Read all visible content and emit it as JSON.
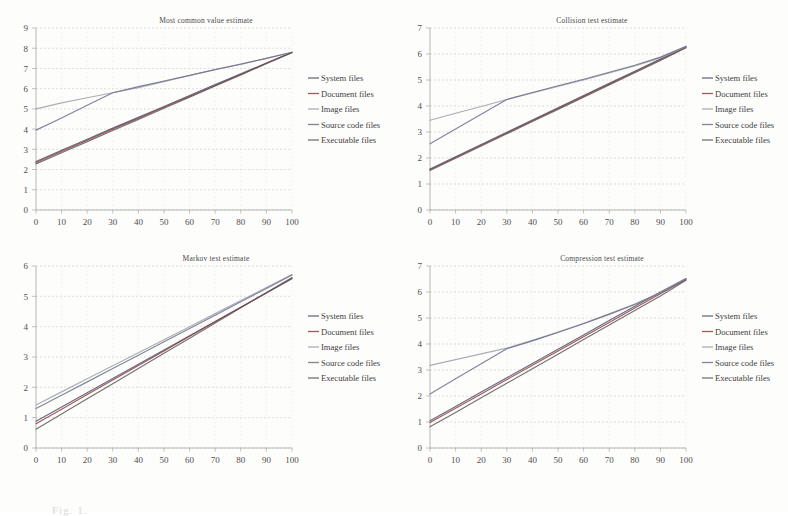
{
  "figure": {
    "caption": "Fig. 1.",
    "series_names": [
      "System files",
      "Document files",
      "Image files",
      "Source code files",
      "Executable files"
    ],
    "series_colors": [
      "#4f4f6e",
      "#8d3f3f",
      "#9aa0a6",
      "#6f6f8c",
      "#5a5a5a"
    ],
    "x_values": [
      0,
      10,
      20,
      30,
      40,
      50,
      60,
      70,
      80,
      90,
      100
    ]
  },
  "chart_data": [
    {
      "type": "line",
      "id": "most-common-value-estimate",
      "title": "Most common value estimate",
      "xlabel": "",
      "ylabel": "",
      "xlim": [
        0,
        100
      ],
      "ylim": [
        0,
        9
      ],
      "xticks": [
        0,
        10,
        20,
        30,
        40,
        50,
        60,
        70,
        80,
        90,
        100
      ],
      "yticks": [
        0,
        1,
        2,
        3,
        4,
        5,
        6,
        7,
        8,
        9
      ],
      "grid": true,
      "legend": "right",
      "x": [
        0,
        10,
        20,
        30,
        40,
        50,
        60,
        70,
        80,
        90,
        100
      ],
      "series": [
        {
          "name": "System files",
          "values": [
            2.4,
            2.95,
            3.5,
            4.05,
            4.58,
            5.12,
            5.66,
            6.2,
            6.73,
            7.27,
            7.8
          ]
        },
        {
          "name": "Document files",
          "values": [
            2.35,
            2.9,
            3.45,
            4.0,
            4.54,
            5.08,
            5.62,
            6.16,
            6.7,
            7.25,
            7.79
          ]
        },
        {
          "name": "Image files",
          "values": [
            5.0,
            5.3,
            5.55,
            5.8,
            6.05,
            6.35,
            6.65,
            6.95,
            7.2,
            7.5,
            7.8
          ]
        },
        {
          "name": "Source code files",
          "values": [
            3.95,
            4.55,
            5.18,
            5.8,
            6.1,
            6.38,
            6.66,
            6.94,
            7.22,
            7.5,
            7.8
          ]
        },
        {
          "name": "Executable files",
          "values": [
            2.28,
            2.83,
            3.38,
            3.93,
            4.48,
            5.03,
            5.58,
            6.13,
            6.68,
            7.24,
            7.78
          ]
        }
      ]
    },
    {
      "type": "line",
      "id": "collision-test-estimate",
      "title": "Collision test estimate",
      "xlabel": "",
      "ylabel": "",
      "xlim": [
        0,
        100
      ],
      "ylim": [
        0,
        7
      ],
      "xticks": [
        0,
        10,
        20,
        30,
        40,
        50,
        60,
        70,
        80,
        90,
        100
      ],
      "yticks": [
        0,
        1,
        2,
        3,
        4,
        5,
        6,
        7
      ],
      "grid": true,
      "legend": "right",
      "x": [
        0,
        10,
        20,
        30,
        40,
        50,
        60,
        70,
        80,
        90,
        100
      ],
      "series": [
        {
          "name": "System files",
          "values": [
            1.58,
            2.05,
            2.52,
            2.99,
            3.46,
            3.93,
            4.4,
            4.87,
            5.34,
            5.81,
            6.28
          ]
        },
        {
          "name": "Document files",
          "values": [
            1.55,
            2.02,
            2.49,
            2.96,
            3.43,
            3.9,
            4.37,
            4.84,
            5.31,
            5.78,
            6.25
          ]
        },
        {
          "name": "Image files",
          "values": [
            3.45,
            3.72,
            3.98,
            4.25,
            4.5,
            4.75,
            5.0,
            5.27,
            5.54,
            5.85,
            6.28
          ]
        },
        {
          "name": "Source code files",
          "values": [
            2.55,
            3.12,
            3.68,
            4.25,
            4.52,
            4.78,
            5.03,
            5.3,
            5.57,
            5.88,
            6.3
          ]
        },
        {
          "name": "Executable files",
          "values": [
            1.52,
            1.99,
            2.46,
            2.93,
            3.4,
            3.87,
            4.34,
            4.81,
            5.28,
            5.75,
            6.24
          ]
        }
      ]
    },
    {
      "type": "line",
      "id": "markov-test-estimate",
      "title": "Markov test estimate",
      "xlabel": "",
      "ylabel": "",
      "xlim": [
        0,
        100
      ],
      "ylim": [
        0,
        6
      ],
      "xticks": [
        0,
        10,
        20,
        30,
        40,
        50,
        60,
        70,
        80,
        90,
        100
      ],
      "yticks": [
        0,
        1,
        2,
        3,
        4,
        5,
        6
      ],
      "grid": true,
      "legend": "right",
      "x": [
        0,
        10,
        20,
        30,
        40,
        50,
        60,
        70,
        80,
        90,
        100
      ],
      "series": [
        {
          "name": "System files",
          "values": [
            0.88,
            1.35,
            1.82,
            2.29,
            2.76,
            3.23,
            3.7,
            4.17,
            4.64,
            5.11,
            5.58
          ]
        },
        {
          "name": "Document files",
          "values": [
            0.8,
            1.28,
            1.76,
            2.24,
            2.72,
            3.2,
            3.68,
            4.16,
            4.64,
            5.12,
            5.6
          ]
        },
        {
          "name": "Image files",
          "values": [
            1.42,
            1.85,
            2.28,
            2.71,
            3.14,
            3.57,
            4.0,
            4.43,
            4.86,
            5.29,
            5.72
          ]
        },
        {
          "name": "Source code files",
          "values": [
            1.3,
            1.74,
            2.18,
            2.62,
            3.06,
            3.5,
            3.94,
            4.38,
            4.82,
            5.26,
            5.7
          ]
        },
        {
          "name": "Executable files",
          "values": [
            0.62,
            1.12,
            1.62,
            2.12,
            2.62,
            3.12,
            3.62,
            4.12,
            4.62,
            5.12,
            5.62
          ]
        }
      ]
    },
    {
      "type": "line",
      "id": "compression-test-estimate",
      "title": "Compression test estimate",
      "xlabel": "",
      "ylabel": "",
      "xlim": [
        0,
        100
      ],
      "ylim": [
        0,
        7
      ],
      "xticks": [
        0,
        10,
        20,
        30,
        40,
        50,
        60,
        70,
        80,
        90,
        100
      ],
      "yticks": [
        0,
        1,
        2,
        3,
        4,
        5,
        6,
        7
      ],
      "grid": true,
      "legend": "right",
      "x": [
        0,
        10,
        20,
        30,
        40,
        50,
        60,
        70,
        80,
        90,
        100
      ],
      "series": [
        {
          "name": "System files",
          "values": [
            1.05,
            1.6,
            2.15,
            2.7,
            3.25,
            3.8,
            4.35,
            4.9,
            5.45,
            6.0,
            6.52
          ]
        },
        {
          "name": "Document files",
          "values": [
            0.98,
            1.53,
            2.08,
            2.63,
            3.18,
            3.73,
            4.28,
            4.83,
            5.38,
            5.93,
            6.48
          ]
        },
        {
          "name": "Image files",
          "values": [
            3.18,
            3.4,
            3.62,
            3.84,
            4.14,
            4.46,
            4.8,
            5.16,
            5.54,
            5.98,
            6.52
          ]
        },
        {
          "name": "Source code files",
          "values": [
            2.08,
            2.66,
            3.24,
            3.82,
            4.12,
            4.44,
            4.78,
            5.14,
            5.52,
            5.96,
            6.5
          ]
        },
        {
          "name": "Executable files",
          "values": [
            0.82,
            1.37,
            1.93,
            2.49,
            3.05,
            3.61,
            4.17,
            4.73,
            5.29,
            5.85,
            6.45
          ]
        }
      ]
    }
  ]
}
